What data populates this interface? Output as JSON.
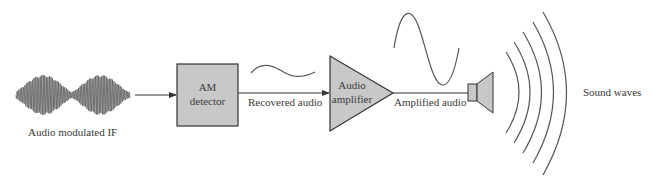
{
  "diagram": {
    "input_signal": {
      "label": "Audio modulated IF",
      "icon": "am-modulated-waveform-icon"
    },
    "blocks": [
      {
        "id": "am-detector",
        "line1": "AM",
        "line2": "detector",
        "shape": "rectangle"
      },
      {
        "id": "audio-amplifier",
        "line1": "Audio",
        "line2": "amplifier",
        "shape": "triangle"
      }
    ],
    "signals": {
      "recovered": {
        "label": "Recovered audio",
        "icon": "small-sine-wave-icon"
      },
      "amplified": {
        "label": "Amplified audio",
        "icon": "large-sine-wave-icon"
      }
    },
    "output": {
      "device": "speaker-icon",
      "label": "Sound waves",
      "icon": "sound-waves-icon"
    },
    "colors": {
      "block_fill": "#c8c8c8",
      "stroke": "#333333",
      "wave": "#555555"
    }
  }
}
